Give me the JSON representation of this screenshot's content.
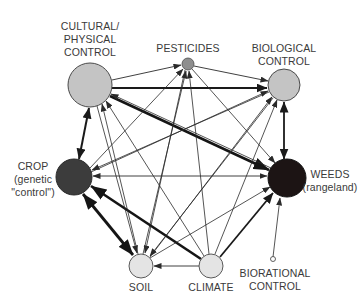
{
  "diagram": {
    "type": "interaction-network",
    "nodes": [
      {
        "id": "cultural",
        "label_lines": [
          "CULTURAL/",
          "PHYSICAL",
          "CONTROL"
        ],
        "x": 90,
        "y": 85,
        "r": 22,
        "fill": "#c4c4c4"
      },
      {
        "id": "pesticides",
        "label_lines": [
          "PESTICIDES"
        ],
        "x": 188,
        "y": 64,
        "r": 6,
        "fill": "#8e8e8e"
      },
      {
        "id": "biological",
        "label_lines": [
          "BIOLOGICAL",
          "CONTROL"
        ],
        "x": 284,
        "y": 85,
        "r": 16,
        "fill": "#c4c4c4"
      },
      {
        "id": "crop",
        "label_lines": [
          "CROP",
          "(genetic",
          "\"control\")"
        ],
        "x": 74,
        "y": 177,
        "r": 18,
        "fill": "#3c3c3c"
      },
      {
        "id": "weeds",
        "label_lines": [
          "WEEDS",
          "(rangeland)"
        ],
        "x": 287,
        "y": 178,
        "r": 19,
        "fill": "#1c1414"
      },
      {
        "id": "soil",
        "label_lines": [
          "SOIL"
        ],
        "x": 141,
        "y": 266,
        "r": 12,
        "fill": "#e4e4e4"
      },
      {
        "id": "climate",
        "label_lines": [
          "CLIMATE"
        ],
        "x": 211,
        "y": 266,
        "r": 12,
        "fill": "#e4e4e4"
      },
      {
        "id": "biorational",
        "label_lines": [
          "BIORATIONAL",
          "CONTROL"
        ],
        "x": 273,
        "y": 260,
        "r": 2.5,
        "fill": "#ffffff"
      }
    ],
    "labels": {
      "cultural": [
        "CULTURAL/",
        "PHYSICAL",
        "CONTROL"
      ],
      "pesticides": "PESTICIDES",
      "biological": [
        "BIOLOGICAL",
        "CONTROL"
      ],
      "crop": [
        "CROP",
        "(genetic",
        "\"control\")"
      ],
      "weeds": [
        "WEEDS",
        "(rangeland)"
      ],
      "soil": "SOIL",
      "climate": "CLIMATE",
      "biorational": [
        "BIORATIONAL",
        "CONTROL"
      ]
    },
    "edges": [
      {
        "from": "cultural",
        "to": "pesticides",
        "weight": "thin",
        "direction": "forward"
      },
      {
        "from": "cultural",
        "to": "biological",
        "weight": "medium",
        "direction": "forward"
      },
      {
        "from": "cultural",
        "to": "weeds",
        "weight": "thick",
        "direction": "forward"
      },
      {
        "from": "cultural",
        "to": "crop",
        "weight": "medium",
        "direction": "both"
      },
      {
        "from": "pesticides",
        "to": "biological",
        "weight": "thin",
        "direction": "forward"
      },
      {
        "from": "crop",
        "to": "pesticides",
        "weight": "thin",
        "direction": "forward"
      },
      {
        "from": "soil",
        "to": "pesticides",
        "weight": "thin",
        "direction": "forward"
      },
      {
        "from": "climate",
        "to": "pesticides",
        "weight": "thin",
        "direction": "forward"
      },
      {
        "from": "crop",
        "to": "biological",
        "weight": "thin",
        "direction": "forward"
      },
      {
        "from": "soil",
        "to": "biological",
        "weight": "thin",
        "direction": "forward"
      },
      {
        "from": "climate",
        "to": "biological",
        "weight": "thin",
        "direction": "forward"
      },
      {
        "from": "weeds",
        "to": "biological",
        "weight": "medium",
        "direction": "both"
      },
      {
        "from": "weeds",
        "to": "crop",
        "weight": "thin",
        "direction": "both"
      },
      {
        "from": "climate",
        "to": "crop",
        "weight": "thick",
        "direction": "forward"
      },
      {
        "from": "soil",
        "to": "crop",
        "weight": "thick",
        "direction": "both"
      },
      {
        "from": "biological",
        "to": "crop",
        "weight": "thin",
        "direction": "forward"
      },
      {
        "from": "soil",
        "to": "cultural",
        "weight": "thin",
        "direction": "forward"
      },
      {
        "from": "climate",
        "to": "cultural",
        "weight": "thin",
        "direction": "forward"
      },
      {
        "from": "weeds",
        "to": "cultural",
        "weight": "thin",
        "direction": "forward"
      },
      {
        "from": "cultural",
        "to": "soil",
        "weight": "thin",
        "direction": "forward"
      },
      {
        "from": "pesticides",
        "to": "soil",
        "weight": "thin",
        "direction": "forward"
      },
      {
        "from": "biological",
        "to": "soil",
        "weight": "thin",
        "direction": "forward"
      },
      {
        "from": "climate",
        "to": "soil",
        "weight": "thin",
        "direction": "forward"
      },
      {
        "from": "pesticides",
        "to": "weeds",
        "weight": "thin",
        "direction": "forward"
      },
      {
        "from": "climate",
        "to": "weeds",
        "weight": "medium",
        "direction": "forward"
      },
      {
        "from": "biorational",
        "to": "weeds",
        "weight": "thin",
        "direction": "forward"
      },
      {
        "from": "soil",
        "to": "weeds",
        "weight": "thin",
        "direction": "forward"
      }
    ],
    "colors": {
      "line": "#2a2a2a",
      "label": "#3a3a3a",
      "node_stroke": "#4a4a4a"
    }
  }
}
